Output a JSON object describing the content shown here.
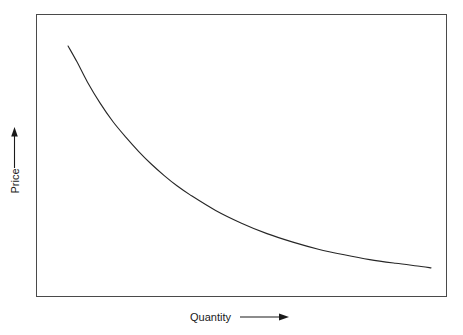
{
  "figure": {
    "background_color": "#ffffff",
    "frame_color": "#4a4a4a",
    "curve_color": "#262626",
    "text_color": "#1a1a1a"
  },
  "axes": {
    "y": {
      "label": "Price",
      "arrow_direction": "up",
      "arrow_name": "up-arrow-icon"
    },
    "x": {
      "label": "Quantity",
      "arrow_direction": "right",
      "arrow_name": "right-arrow-icon"
    }
  },
  "chart_data": {
    "type": "line",
    "title": "",
    "subtitle": "",
    "xlabel": "Quantity",
    "ylabel": "Price",
    "grid": false,
    "legend": null,
    "legend_position": "none",
    "axis_tick_labels": {
      "x": [],
      "y": []
    },
    "xlim": [
      0,
      100
    ],
    "ylim": [
      0,
      100
    ],
    "series": [
      {
        "name": "Demand curve",
        "shape": "convex-decreasing",
        "x": [
          7.8,
          10.0,
          12.5,
          15.6,
          18.7,
          21.9,
          25.0,
          28.1,
          31.2,
          34.3,
          37.5,
          43.7,
          50.0,
          56.2,
          62.5,
          68.7,
          75.0,
          81.2,
          87.5,
          93.7,
          96.1
        ],
        "y": [
          88.7,
          83.0,
          76.0,
          68.5,
          62.0,
          56.4,
          51.4,
          46.9,
          42.9,
          39.3,
          36.1,
          30.6,
          26.1,
          22.4,
          19.4,
          16.9,
          14.9,
          13.2,
          11.9,
          10.8,
          10.3
        ]
      }
    ],
    "annotations": []
  }
}
